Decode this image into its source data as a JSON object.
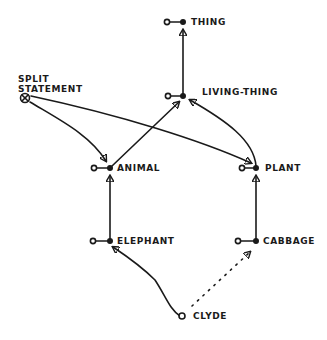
{
  "diagram": {
    "type": "semantic-network",
    "colors": {
      "ink": "#1a1a1a",
      "background": "#ffffff"
    },
    "nodes": [
      {
        "id": "thing",
        "label": "THING"
      },
      {
        "id": "living-thing",
        "label": "LIVING-THING"
      },
      {
        "id": "animal",
        "label": "ANIMAL"
      },
      {
        "id": "plant",
        "label": "PLANT"
      },
      {
        "id": "elephant",
        "label": "ELEPHANT"
      },
      {
        "id": "cabbage",
        "label": "CABBAGE"
      },
      {
        "id": "clyde",
        "label": "CLYDE"
      },
      {
        "id": "split",
        "label_line1": "SPLIT",
        "label_line2": "STATEMENT"
      }
    ],
    "edges": [
      {
        "from": "living-thing",
        "to": "thing",
        "style": "solid"
      },
      {
        "from": "animal",
        "to": "living-thing",
        "style": "solid"
      },
      {
        "from": "plant",
        "to": "living-thing",
        "style": "solid"
      },
      {
        "from": "elephant",
        "to": "animal",
        "style": "solid"
      },
      {
        "from": "cabbage",
        "to": "plant",
        "style": "solid"
      },
      {
        "from": "clyde",
        "to": "elephant",
        "style": "solid"
      },
      {
        "from": "clyde",
        "to": "cabbage",
        "style": "dotted"
      },
      {
        "from": "split",
        "to": "animal",
        "style": "solid"
      },
      {
        "from": "split",
        "to": "plant",
        "style": "solid"
      }
    ]
  }
}
